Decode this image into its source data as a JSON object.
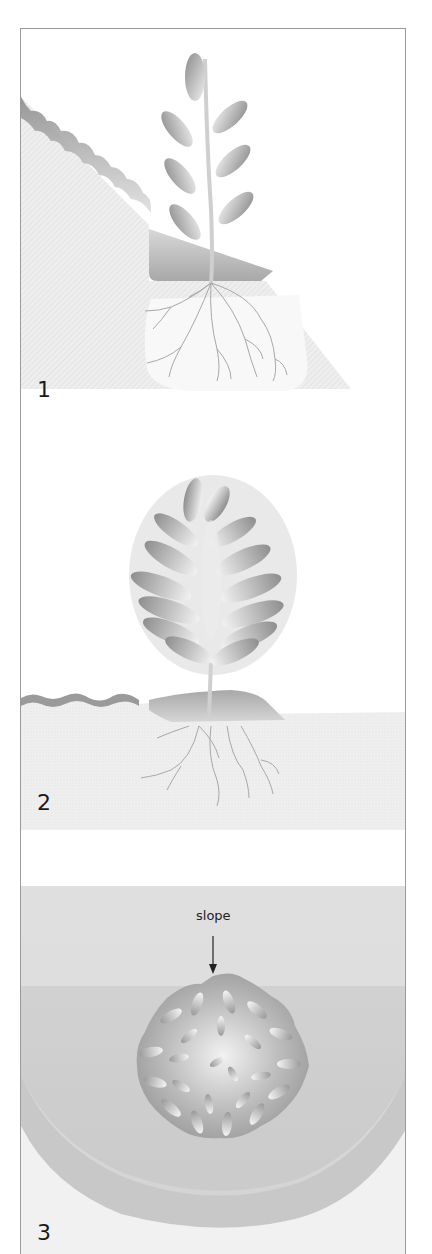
{
  "figure": {
    "panels": [
      {
        "step": "1",
        "scene": "Young plant set into a cut terrace on a sloping bank, roots spreading into loosened soil",
        "elements": [
          "slope",
          "terrace-pocket",
          "sapling",
          "leaves",
          "roots"
        ]
      },
      {
        "step": "2",
        "scene": "Established shrub with dense foliage on level planting area, roots spread below",
        "elements": [
          "ground-line",
          "mound",
          "shrub",
          "roots"
        ]
      },
      {
        "step": "3",
        "scene": "Top-down view of the shrub planted in a curved bowl-shaped terrace on the slope",
        "elements": [
          "bowl-terrace",
          "shrub-topview",
          "slope-callout"
        ],
        "callout": {
          "label": "slope",
          "pointer": "down-arrow"
        }
      }
    ]
  },
  "colors": {
    "frame": "#9a9a9a",
    "soil_light": "#ececec",
    "soil_mid": "#d2d2d2",
    "soil_dark": "#b4b4b4",
    "leaf_dark": "#8f8f8f",
    "leaf_light": "#f2f2f2",
    "root": "#a8a8a8",
    "text": "#1a1a1a"
  }
}
